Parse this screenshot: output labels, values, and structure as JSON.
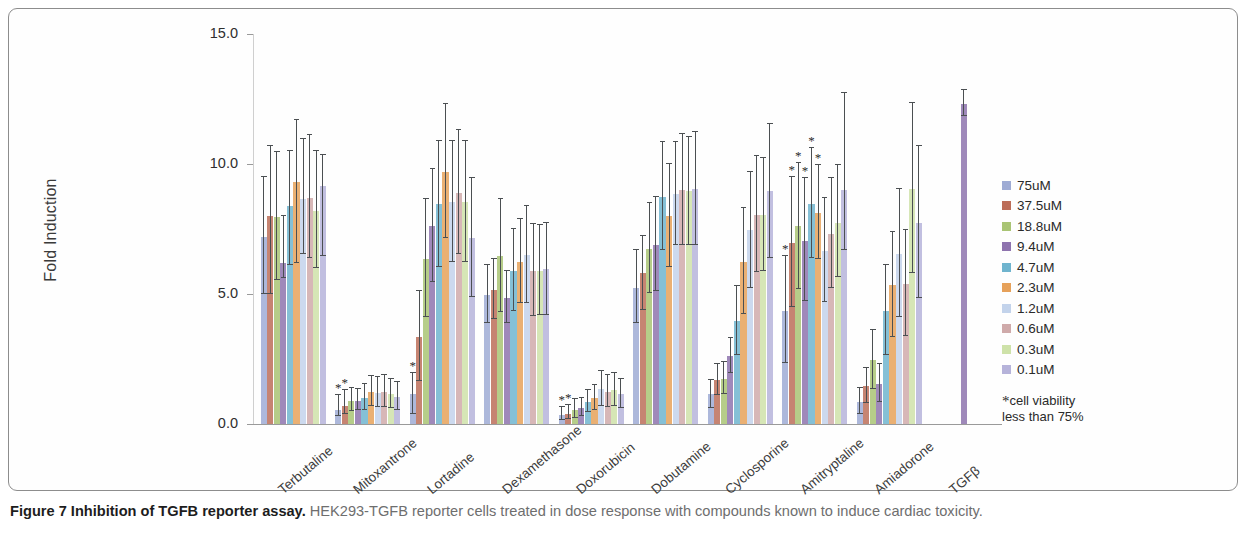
{
  "figure": {
    "caption_label": "Figure 7",
    "caption_title": "Inhibition of TGFB reporter assay.",
    "caption_body": "HEK293-TGFB reporter cells treated in dose response with compounds known to induce cardiac toxicity."
  },
  "legend": {
    "note_star": "*",
    "note_line1": "cell viability",
    "note_line2": "less than 75%"
  },
  "chart_data": {
    "type": "bar",
    "title": "",
    "xlabel": "",
    "ylabel": "Fold Induction",
    "ylim": [
      0,
      15
    ],
    "yticks": [
      "0.0",
      "5.0",
      "10.0",
      "15.0"
    ],
    "ytick_values": [
      0,
      5,
      10,
      15
    ],
    "grid": false,
    "legend_position": "right",
    "error_bars": "SD",
    "categories": [
      "Terbutaline",
      "Mitoxantrone",
      "Lortadine",
      "Dexamethasone",
      "Doxorubicin",
      "Dobutamine",
      "Cyclosporine",
      "Amitryptaline",
      "Amiadorone",
      "TGFβ"
    ],
    "series": [
      {
        "name": "75uM",
        "color": "#8d9ccd",
        "values": [
          7.2,
          0.55,
          1.15,
          4.95,
          0.35,
          5.25,
          1.15,
          4.35,
          0.85,
          null
        ],
        "err_low": [
          2.2,
          0.25,
          0.75,
          1.05,
          0.2,
          1.35,
          0.55,
          2.0,
          0.45,
          null
        ],
        "err_high": [
          2.3,
          0.55,
          0.8,
          1.15,
          0.3,
          1.45,
          0.55,
          2.1,
          0.55,
          null
        ],
        "starred": [
          false,
          true,
          true,
          false,
          true,
          false,
          false,
          true,
          false,
          false
        ]
      },
      {
        "name": "37.5uM",
        "color": "#b0543b",
        "values": [
          8.0,
          0.7,
          3.35,
          5.15,
          0.4,
          5.8,
          1.7,
          6.95,
          1.45,
          null
        ],
        "err_low": [
          3.0,
          0.3,
          1.7,
          1.1,
          0.2,
          1.4,
          0.6,
          2.45,
          0.65,
          null
        ],
        "err_high": [
          2.7,
          0.6,
          1.75,
          1.2,
          0.35,
          1.45,
          0.6,
          2.55,
          0.7,
          null
        ],
        "starred": [
          false,
          true,
          false,
          false,
          true,
          false,
          false,
          true,
          false,
          false
        ]
      },
      {
        "name": "18.8uM",
        "color": "#9aba5c",
        "values": [
          7.95,
          0.9,
          6.35,
          6.45,
          0.55,
          6.75,
          1.75,
          7.6,
          2.45,
          null
        ],
        "err_low": [
          2.4,
          0.4,
          2.25,
          2.15,
          0.3,
          1.7,
          0.6,
          2.4,
          1.1,
          null
        ],
        "err_high": [
          2.5,
          0.5,
          2.3,
          2.2,
          0.4,
          1.75,
          0.65,
          2.45,
          1.15,
          null
        ],
        "starred": [
          false,
          false,
          false,
          false,
          false,
          false,
          false,
          true,
          false,
          false
        ]
      },
      {
        "name": "9.4uM",
        "color": "#7a5ba0",
        "values": [
          6.2,
          0.9,
          7.6,
          4.85,
          0.6,
          6.9,
          2.6,
          7.05,
          1.55,
          12.3
        ],
        "err_low": [
          0.6,
          0.35,
          2.15,
          0.95,
          0.3,
          1.8,
          0.65,
          2.3,
          0.7,
          0.45
        ],
        "err_high": [
          1.8,
          0.45,
          2.2,
          1.05,
          0.4,
          1.85,
          0.7,
          2.4,
          0.75,
          0.55
        ],
        "starred": [
          false,
          false,
          false,
          false,
          false,
          false,
          false,
          true,
          false,
          false
        ]
      },
      {
        "name": "4.7uM",
        "color": "#56a7c6",
        "values": [
          8.4,
          1.0,
          8.45,
          5.9,
          0.85,
          8.75,
          3.95,
          8.45,
          4.35,
          null
        ],
        "err_low": [
          2.3,
          0.45,
          2.4,
          1.55,
          0.4,
          2.05,
          1.3,
          2.05,
          1.7,
          null
        ],
        "err_high": [
          2.1,
          0.55,
          2.45,
          1.6,
          0.45,
          2.1,
          1.35,
          2.15,
          1.75,
          null
        ],
        "starred": [
          false,
          false,
          false,
          false,
          false,
          false,
          false,
          true,
          false,
          false
        ]
      },
      {
        "name": "2.3uM",
        "color": "#e2913d",
        "values": [
          9.3,
          1.25,
          9.7,
          6.25,
          1.0,
          8.0,
          6.25,
          8.1,
          5.35,
          null
        ],
        "err_low": [
          3.1,
          0.55,
          2.55,
          1.6,
          0.45,
          1.95,
          2.0,
          1.75,
          2.0,
          null
        ],
        "err_high": [
          2.4,
          0.6,
          2.6,
          1.65,
          0.5,
          2.0,
          2.05,
          1.85,
          2.05,
          null
        ],
        "starred": [
          false,
          false,
          false,
          false,
          false,
          false,
          false,
          true,
          false,
          false
        ]
      },
      {
        "name": "1.2uM",
        "color": "#b8cbe8",
        "values": [
          8.65,
          1.2,
          8.55,
          6.5,
          1.35,
          8.85,
          7.45,
          6.65,
          6.55,
          null
        ],
        "err_low": [
          2.1,
          0.55,
          2.3,
          1.85,
          0.65,
          1.95,
          2.2,
          1.95,
          2.45,
          null
        ],
        "err_high": [
          2.3,
          0.6,
          2.35,
          1.9,
          0.7,
          2.0,
          2.25,
          2.05,
          2.5,
          null
        ],
        "starred": [
          false,
          false,
          false,
          false,
          false,
          false,
          false,
          false,
          false,
          false
        ]
      },
      {
        "name": "0.6uM",
        "color": "#c79b9b",
        "values": [
          8.7,
          1.25,
          8.9,
          5.9,
          1.25,
          9.0,
          8.05,
          7.3,
          5.4,
          null
        ],
        "err_low": [
          2.3,
          0.6,
          2.35,
          1.75,
          0.6,
          2.1,
          2.2,
          2.05,
          2.0,
          null
        ],
        "err_high": [
          2.4,
          0.65,
          2.4,
          1.8,
          0.65,
          2.15,
          2.25,
          2.15,
          2.05,
          null
        ],
        "starred": [
          false,
          false,
          false,
          false,
          false,
          false,
          false,
          false,
          false,
          false
        ]
      },
      {
        "name": "0.3uM",
        "color": "#c6dd9a",
        "values": [
          8.2,
          1.15,
          8.55,
          5.9,
          1.3,
          8.95,
          8.05,
          7.75,
          9.05,
          null
        ],
        "err_low": [
          2.2,
          0.55,
          2.3,
          1.7,
          0.6,
          2.05,
          2.15,
          2.1,
          3.25,
          null
        ],
        "err_high": [
          2.3,
          0.6,
          2.35,
          1.75,
          0.65,
          2.1,
          2.2,
          2.2,
          3.3,
          null
        ],
        "starred": [
          false,
          false,
          false,
          false,
          false,
          false,
          false,
          false,
          false,
          false
        ]
      },
      {
        "name": "0.1uM",
        "color": "#a9a6d4",
        "values": [
          9.15,
          1.05,
          7.15,
          5.95,
          1.15,
          9.05,
          8.95,
          9.0,
          7.75,
          null
        ],
        "err_low": [
          2.7,
          0.5,
          2.25,
          1.75,
          0.55,
          2.15,
          2.55,
          2.3,
          2.9,
          null
        ],
        "err_high": [
          1.2,
          0.55,
          2.3,
          1.8,
          0.6,
          2.2,
          2.6,
          3.75,
          2.95,
          null
        ],
        "starred": [
          false,
          false,
          false,
          false,
          false,
          false,
          false,
          false,
          false,
          false
        ]
      }
    ]
  }
}
